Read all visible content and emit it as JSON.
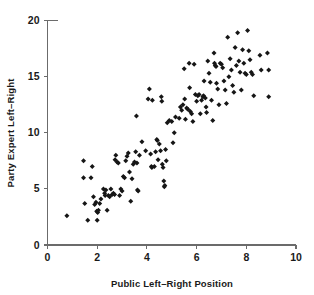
{
  "figure": {
    "background_color": "#ffffff",
    "marker_color": "#161616",
    "axis_color": "#6b6b6b",
    "marker_shape": "diamond"
  },
  "chart_data": {
    "type": "scatter",
    "title": "",
    "xlabel": "Public Left–Right Position",
    "ylabel": "Party Expert Left–Right",
    "xlim": [
      0,
      10
    ],
    "ylim": [
      0,
      20
    ],
    "xticks": [
      0,
      2,
      4,
      6,
      8,
      10
    ],
    "yticks": [
      0,
      5,
      10,
      15,
      20
    ],
    "xtick_labels": [
      "0",
      "2",
      "4",
      "6",
      "8",
      "10"
    ],
    "ytick_labels": [
      "0",
      "5",
      "10",
      "15",
      "20"
    ],
    "grid": false,
    "legend": null,
    "series": [
      {
        "name": "parties",
        "points": [
          [
            0.78,
            2.6
          ],
          [
            1.45,
            7.5
          ],
          [
            1.45,
            6.0
          ],
          [
            1.5,
            3.7
          ],
          [
            1.62,
            2.2
          ],
          [
            1.75,
            6.0
          ],
          [
            1.8,
            7.0
          ],
          [
            1.85,
            4.3
          ],
          [
            1.9,
            3.6
          ],
          [
            1.95,
            3.8
          ],
          [
            1.98,
            3.0
          ],
          [
            2.0,
            2.2
          ],
          [
            2.02,
            2.9
          ],
          [
            2.05,
            3.1
          ],
          [
            2.1,
            3.7
          ],
          [
            2.15,
            4.1
          ],
          [
            2.25,
            5.0
          ],
          [
            2.3,
            4.6
          ],
          [
            2.32,
            4.4
          ],
          [
            2.35,
            4.9
          ],
          [
            2.4,
            3.1
          ],
          [
            2.45,
            4.4
          ],
          [
            2.5,
            4.3
          ],
          [
            2.55,
            5.0
          ],
          [
            2.6,
            4.5
          ],
          [
            2.65,
            4.6
          ],
          [
            2.7,
            4.5
          ],
          [
            2.72,
            7.6
          ],
          [
            2.75,
            8.0
          ],
          [
            2.8,
            7.4
          ],
          [
            2.85,
            7.3
          ],
          [
            2.9,
            4.4
          ],
          [
            2.95,
            5.0
          ],
          [
            3.0,
            4.8
          ],
          [
            3.05,
            6.1
          ],
          [
            3.1,
            6.0
          ],
          [
            3.15,
            7.5
          ],
          [
            3.2,
            7.9
          ],
          [
            3.25,
            8.2
          ],
          [
            3.3,
            6.5
          ],
          [
            3.35,
            3.9
          ],
          [
            3.4,
            5.9
          ],
          [
            3.45,
            7.2
          ],
          [
            3.5,
            7.4
          ],
          [
            3.55,
            8.3
          ],
          [
            3.58,
            11.5
          ],
          [
            3.6,
            7.3
          ],
          [
            3.62,
            4.9
          ],
          [
            3.65,
            4.8
          ],
          [
            3.7,
            8.0
          ],
          [
            3.8,
            9.2
          ],
          [
            3.95,
            8.4
          ],
          [
            4.05,
            13.0
          ],
          [
            4.1,
            13.9
          ],
          [
            4.15,
            8.1
          ],
          [
            4.18,
            7.0
          ],
          [
            4.2,
            6.9
          ],
          [
            4.22,
            12.9
          ],
          [
            4.3,
            7.0
          ],
          [
            4.35,
            8.3
          ],
          [
            4.4,
            9.4
          ],
          [
            4.42,
            9.3
          ],
          [
            4.45,
            7.6
          ],
          [
            4.5,
            9.0
          ],
          [
            4.55,
            8.4
          ],
          [
            4.58,
            13.2
          ],
          [
            4.6,
            12.8
          ],
          [
            4.62,
            7.2
          ],
          [
            4.65,
            6.9
          ],
          [
            4.68,
            5.7
          ],
          [
            4.7,
            5.2
          ],
          [
            4.72,
            5.3
          ],
          [
            4.75,
            8.5
          ],
          [
            4.78,
            7.5
          ],
          [
            4.82,
            10.9
          ],
          [
            4.9,
            11.1
          ],
          [
            5.0,
            11.0
          ],
          [
            5.05,
            9.1
          ],
          [
            5.1,
            10.0
          ],
          [
            5.15,
            11.4
          ],
          [
            5.3,
            11.3
          ],
          [
            5.35,
            12.3
          ],
          [
            5.4,
            12.0
          ],
          [
            5.45,
            12.5
          ],
          [
            5.5,
            15.7
          ],
          [
            5.52,
            13.0
          ],
          [
            5.55,
            11.2
          ],
          [
            5.6,
            12.2
          ],
          [
            5.65,
            12.1
          ],
          [
            5.7,
            16.2
          ],
          [
            5.72,
            14.0
          ],
          [
            5.75,
            11.9
          ],
          [
            5.8,
            11.7
          ],
          [
            5.85,
            11.0
          ],
          [
            5.9,
            16.1
          ],
          [
            5.95,
            13.4
          ],
          [
            6.0,
            12.8
          ],
          [
            6.05,
            13.3
          ],
          [
            6.1,
            13.4
          ],
          [
            6.15,
            11.7
          ],
          [
            6.2,
            12.9
          ],
          [
            6.25,
            13.2
          ],
          [
            6.28,
            13.3
          ],
          [
            6.3,
            14.6
          ],
          [
            6.35,
            13.1
          ],
          [
            6.38,
            12.3
          ],
          [
            6.4,
            11.8
          ],
          [
            6.45,
            16.4
          ],
          [
            6.5,
            15.3
          ],
          [
            6.55,
            14.5
          ],
          [
            6.6,
            12.9
          ],
          [
            6.65,
            11.1
          ],
          [
            6.7,
            17.1
          ],
          [
            6.72,
            16.2
          ],
          [
            6.75,
            16.0
          ],
          [
            6.78,
            15.9
          ],
          [
            6.8,
            14.4
          ],
          [
            6.85,
            13.9
          ],
          [
            6.9,
            12.5
          ],
          [
            6.95,
            16.2
          ],
          [
            7.0,
            16.1
          ],
          [
            7.05,
            15.8
          ],
          [
            7.1,
            14.6
          ],
          [
            7.15,
            13.8
          ],
          [
            7.2,
            12.6
          ],
          [
            7.25,
            18.5
          ],
          [
            7.3,
            15.0
          ],
          [
            7.35,
            16.6
          ],
          [
            7.4,
            15.6
          ],
          [
            7.45,
            14.2
          ],
          [
            7.5,
            13.6
          ],
          [
            7.55,
            17.6
          ],
          [
            7.6,
            16.0
          ],
          [
            7.65,
            18.9
          ],
          [
            7.7,
            16.4
          ],
          [
            7.75,
            15.4
          ],
          [
            7.8,
            13.8
          ],
          [
            7.85,
            17.4
          ],
          [
            7.9,
            16.2
          ],
          [
            7.95,
            15.3
          ],
          [
            8.0,
            15.2
          ],
          [
            8.05,
            19.1
          ],
          [
            8.1,
            17.3
          ],
          [
            8.15,
            16.5
          ],
          [
            8.2,
            15.4
          ],
          [
            8.25,
            15.2
          ],
          [
            8.3,
            13.3
          ],
          [
            8.55,
            16.9
          ],
          [
            8.6,
            15.6
          ],
          [
            8.85,
            17.1
          ],
          [
            8.9,
            15.6
          ],
          [
            8.9,
            13.2
          ]
        ]
      }
    ]
  }
}
